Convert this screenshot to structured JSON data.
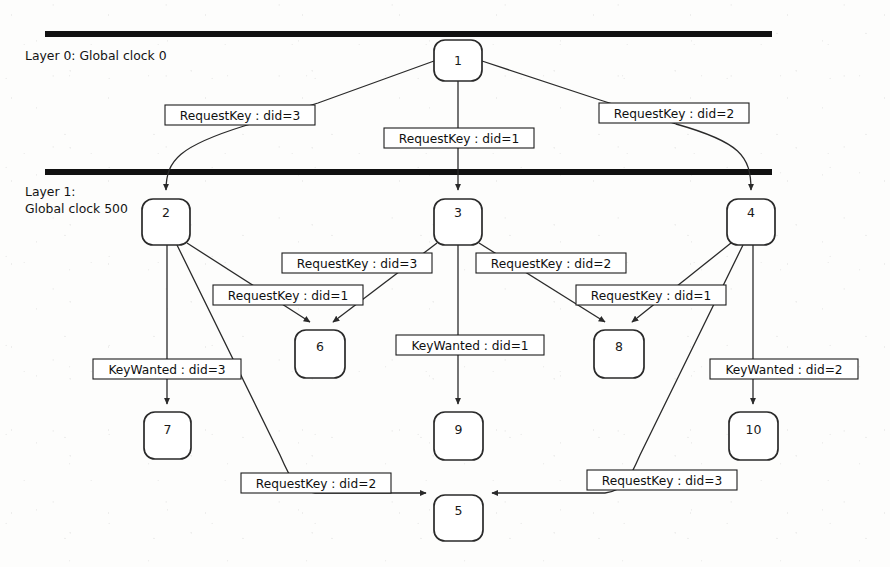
{
  "diagram": {
    "background_color": "#fdfdfc",
    "stroke_color": "#2a2a2a",
    "bar_color": "#111111",
    "layers": [
      {
        "id": "layer0",
        "label": "Layer 0: Global clock 0",
        "bar_y": 31
      },
      {
        "id": "layer1",
        "label_line1": "Layer 1:",
        "label_line2": "Global clock 500",
        "bar_y": 169
      }
    ],
    "nodes": [
      {
        "id": "n1",
        "label": "1",
        "x": 434,
        "y": 40,
        "w": 48,
        "h": 41
      },
      {
        "id": "n2",
        "label": "2",
        "x": 142,
        "y": 199,
        "w": 48,
        "h": 46
      },
      {
        "id": "n3",
        "label": "3",
        "x": 434,
        "y": 199,
        "w": 48,
        "h": 46
      },
      {
        "id": "n4",
        "label": "4",
        "x": 727,
        "y": 199,
        "w": 48,
        "h": 46
      },
      {
        "id": "n6",
        "label": "6",
        "x": 295,
        "y": 330,
        "w": 50,
        "h": 48
      },
      {
        "id": "n8",
        "label": "8",
        "x": 594,
        "y": 330,
        "w": 50,
        "h": 48
      },
      {
        "id": "n7",
        "label": "7",
        "x": 144,
        "y": 412,
        "w": 47,
        "h": 47
      },
      {
        "id": "n9",
        "label": "9",
        "x": 434,
        "y": 412,
        "w": 49,
        "h": 48
      },
      {
        "id": "n10",
        "label": "10",
        "x": 729,
        "y": 412,
        "w": 49,
        "h": 48
      },
      {
        "id": "n5",
        "label": "5",
        "x": 434,
        "y": 495,
        "w": 49,
        "h": 46
      }
    ],
    "edges": [
      {
        "id": "e1",
        "from": "n1",
        "to": "n2",
        "label": "RequestKey : did=3",
        "label_x": 240,
        "label_y": 115
      },
      {
        "id": "e2",
        "from": "n1",
        "to": "n3",
        "label": "RequestKey : did=1",
        "label_x": 459,
        "label_y": 138
      },
      {
        "id": "e3",
        "from": "n1",
        "to": "n4",
        "label": "RequestKey : did=2",
        "label_x": 674,
        "label_y": 113
      },
      {
        "id": "e4",
        "from": "n2",
        "to": "n6",
        "label": "RequestKey : did=1",
        "label_x": 288,
        "label_y": 295
      },
      {
        "id": "e5",
        "from": "n3",
        "to": "n6",
        "label": "RequestKey : did=3",
        "label_x": 357,
        "label_y": 263
      },
      {
        "id": "e6",
        "from": "n3",
        "to": "n8",
        "label": "RequestKey : did=2",
        "label_x": 551,
        "label_y": 263
      },
      {
        "id": "e7",
        "from": "n4",
        "to": "n8",
        "label": "RequestKey : did=1",
        "label_x": 651,
        "label_y": 295
      },
      {
        "id": "e8",
        "from": "n2",
        "to": "n7",
        "label": "KeyWanted : did=3",
        "label_x": 167,
        "label_y": 369
      },
      {
        "id": "e9",
        "from": "n3",
        "to": "n9",
        "label": "KeyWanted : did=1",
        "label_x": 470,
        "label_y": 345
      },
      {
        "id": "e10",
        "from": "n4",
        "to": "n10",
        "label": "KeyWanted : did=2",
        "label_x": 784,
        "label_y": 369
      },
      {
        "id": "e11",
        "from": "n2",
        "to": "n5",
        "label": "RequestKey : did=2",
        "label_x": 316,
        "label_y": 483
      },
      {
        "id": "e12",
        "from": "n4",
        "to": "n5",
        "label": "RequestKey : did=3",
        "label_x": 662,
        "label_y": 480
      }
    ]
  }
}
